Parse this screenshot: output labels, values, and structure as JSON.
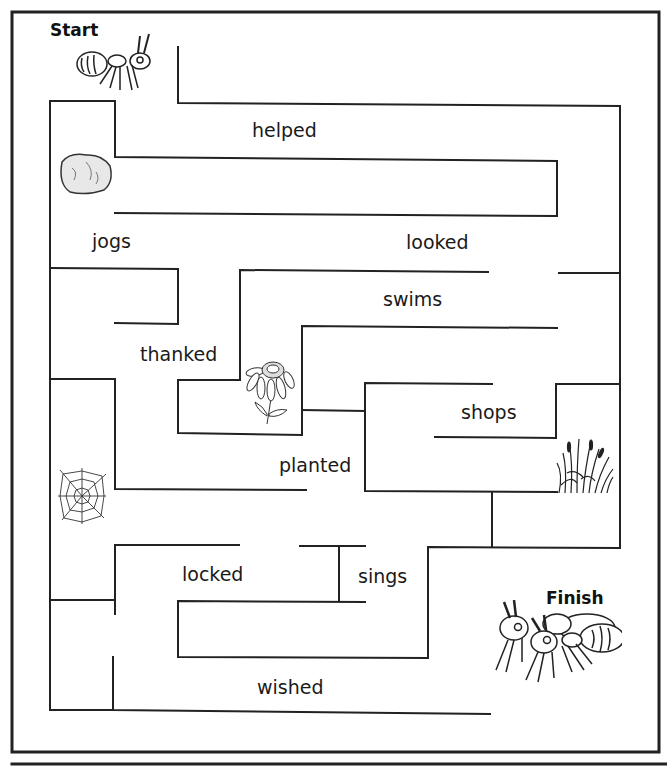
{
  "maze": {
    "start_label": "Start",
    "finish_label": "Finish",
    "words": [
      {
        "text": "helped",
        "x": 252,
        "y": 119
      },
      {
        "text": "jogs",
        "x": 92,
        "y": 230
      },
      {
        "text": "looked",
        "x": 406,
        "y": 231
      },
      {
        "text": "swims",
        "x": 383,
        "y": 288
      },
      {
        "text": "thanked",
        "x": 140,
        "y": 343
      },
      {
        "text": "shops",
        "x": 461,
        "y": 401
      },
      {
        "text": "planted",
        "x": 279,
        "y": 454
      },
      {
        "text": "locked",
        "x": 182,
        "y": 563
      },
      {
        "text": "sings",
        "x": 358,
        "y": 565
      },
      {
        "text": "wished",
        "x": 257,
        "y": 676
      }
    ],
    "pictures": [
      "ant-icon",
      "rock-icon",
      "flower-icon",
      "spider-web-icon",
      "grass-icon",
      "two-ants-icon"
    ],
    "line_color": "#222222"
  }
}
